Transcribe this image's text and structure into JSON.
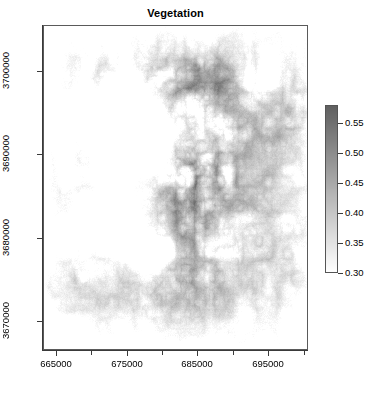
{
  "chart_data": {
    "type": "heatmap",
    "title": "Vegetation",
    "xlabel": "",
    "ylabel": "",
    "grid": false,
    "legend_position": "right",
    "colormap": {
      "name": "grayscale-reversed",
      "low_color": "#ffffff",
      "high_color": "#606060",
      "vmin": 0.3,
      "vmax": 0.58
    },
    "x_axis": {
      "ticks": [
        665000,
        675000,
        685000,
        695000
      ],
      "tick_labels": [
        "665000",
        "675000",
        "685000",
        "695000"
      ],
      "minor_ticks": [
        670000,
        680000,
        690000,
        700000
      ],
      "xlim": [
        663200,
        700600
      ]
    },
    "y_axis": {
      "ticks": [
        3670000,
        3680000,
        3690000,
        3700000
      ],
      "tick_labels": [
        "3670000",
        "3680000",
        "3690000",
        "3700000"
      ],
      "ylim": [
        3666500,
        3705500
      ]
    },
    "colorbar": {
      "ticks": [
        0.3,
        0.35,
        0.4,
        0.45,
        0.5,
        0.55
      ],
      "tick_labels": [
        "0.30",
        "0.35",
        "0.40",
        "0.45",
        "0.50",
        "0.55"
      ],
      "vmin": 0.3,
      "vmax": 0.58
    },
    "value_stats": {
      "min": 0.3,
      "max": 0.58,
      "mean_estimate": 0.33,
      "median_estimate": 0.31
    }
  },
  "plot": {
    "title": "Vegetation"
  }
}
